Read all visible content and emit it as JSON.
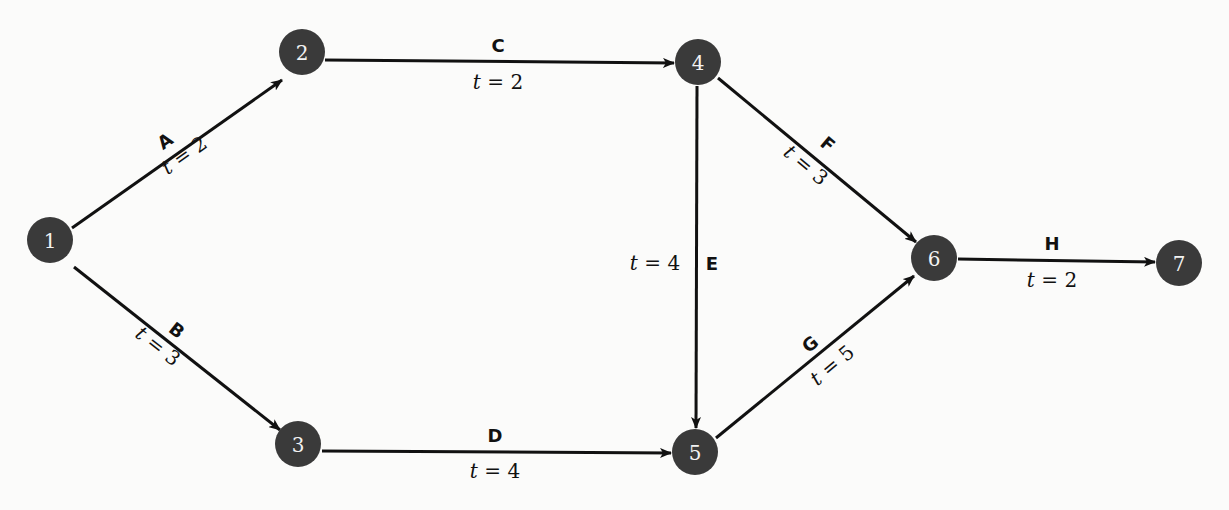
{
  "diagram": {
    "type": "activity-network",
    "nodes": [
      {
        "id": "1",
        "label": "1",
        "x": 50,
        "y": 240
      },
      {
        "id": "2",
        "label": "2",
        "x": 302,
        "y": 52
      },
      {
        "id": "3",
        "label": "3",
        "x": 298,
        "y": 444
      },
      {
        "id": "4",
        "label": "4",
        "x": 698,
        "y": 62
      },
      {
        "id": "5",
        "label": "5",
        "x": 695,
        "y": 452
      },
      {
        "id": "6",
        "label": "6",
        "x": 934,
        "y": 258
      },
      {
        "id": "7",
        "label": "7",
        "x": 1179,
        "y": 263
      }
    ],
    "edges": [
      {
        "id": "A",
        "name": "A",
        "from": "1",
        "to": "2",
        "var": "t",
        "eq": " = ",
        "value": "2",
        "weight_text": "t = 2"
      },
      {
        "id": "B",
        "name": "B",
        "from": "1",
        "to": "3",
        "var": "t",
        "eq": " = ",
        "value": "3",
        "weight_text": "t = 3"
      },
      {
        "id": "C",
        "name": "C",
        "from": "2",
        "to": "4",
        "var": "t",
        "eq": " = ",
        "value": "2",
        "weight_text": "t = 2"
      },
      {
        "id": "D",
        "name": "D",
        "from": "3",
        "to": "5",
        "var": "t",
        "eq": " = ",
        "value": "4",
        "weight_text": "t = 4"
      },
      {
        "id": "E",
        "name": "E",
        "from": "4",
        "to": "5",
        "var": "t",
        "eq": " = ",
        "value": "4",
        "weight_text": "t = 4"
      },
      {
        "id": "F",
        "name": "F",
        "from": "4",
        "to": "6",
        "var": "t",
        "eq": " = ",
        "value": "3",
        "weight_text": "t = 3"
      },
      {
        "id": "G",
        "name": "G",
        "from": "5",
        "to": "6",
        "var": "t",
        "eq": " = ",
        "value": "5",
        "weight_text": "t = 5"
      },
      {
        "id": "H",
        "name": "H",
        "from": "6",
        "to": "7",
        "var": "t",
        "eq": " = ",
        "value": "2",
        "weight_text": "t = 2"
      }
    ]
  }
}
